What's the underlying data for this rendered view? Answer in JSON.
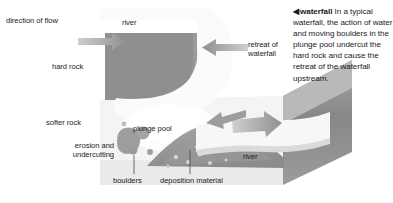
{
  "figure": {
    "title_term": "waterfall",
    "caption_marker": "◀",
    "caption_text": "In a typical waterfall, the action of water and moving boulders in the plunge pool undercut the hard rock and cause the retreat of the waterfall upstream.",
    "labels": {
      "direction_of_flow": "direction of flow",
      "river_top": "river",
      "hard_rock": "hard rock",
      "softer_rock": "softer rock",
      "erosion_and_undercutting": "erosion and undercutting",
      "plunge_pool": "plunge pool",
      "retreat_of_waterfall": "retreat of waterfall",
      "boulders": "boulders",
      "deposition_material": "deposition material",
      "river_bottom": "river"
    },
    "icons": {
      "flow_arrow_top": "arrow-right-icon",
      "retreat_arrow": "arrow-left-icon",
      "flow_arrow_bottom": "arrow-right-icon",
      "retreat_arrow_small": "arrow-left-icon",
      "caption_pointer": "triangle-left-icon"
    },
    "colors": {
      "background": "#ffffff",
      "hard_rock": "#8f8f8f",
      "hard_rock_side": "#7b7b7b",
      "softer_rock": "#f2f2f2",
      "softer_rock_side": "#d8d8d8",
      "block_side_dark": "#9a9a9a",
      "water": "#fbfbfb",
      "deposition": "#9e9e9e",
      "boulders": "#9c9c9c",
      "arrow": "#a8a8a8",
      "text": "#1b1b1b"
    }
  }
}
